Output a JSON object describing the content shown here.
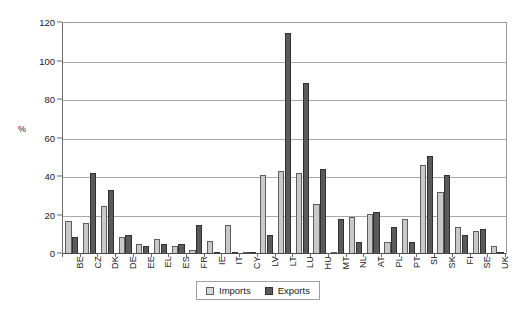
{
  "chart_data": {
    "type": "bar",
    "title": "",
    "xlabel": "",
    "ylabel": "%",
    "ylim": [
      0,
      120
    ],
    "yticks": [
      0,
      20,
      40,
      60,
      80,
      100,
      120
    ],
    "grid": true,
    "legend_position": "bottom-center",
    "categories": [
      "BE",
      "CZ",
      "DK",
      "DE",
      "EE",
      "EL",
      "ES",
      "FR",
      "IE",
      "IT",
      "CY",
      "LV",
      "LT",
      "LU",
      "HU",
      "MT",
      "NL",
      "AT",
      "PL",
      "PT",
      "SI",
      "SK",
      "FI",
      "SE",
      "UK"
    ],
    "series": [
      {
        "name": "Imports",
        "color": "#c9c9c9",
        "values": [
          17,
          16,
          25,
          9,
          5,
          8,
          4,
          2,
          7,
          15,
          0.4,
          41,
          43,
          42,
          26,
          0.3,
          19,
          21,
          6,
          18,
          46,
          32,
          14,
          12,
          4
        ]
      },
      {
        "name": "Exports",
        "color": "#5a5a5a",
        "values": [
          9,
          42,
          33,
          10,
          4,
          5,
          5,
          15,
          0.3,
          0.5,
          0.3,
          10,
          115,
          89,
          44,
          18,
          6,
          22,
          14,
          6,
          51,
          41,
          10,
          13,
          1
        ]
      }
    ]
  },
  "legend": {
    "items": [
      {
        "label": "Imports"
      },
      {
        "label": "Exports"
      }
    ]
  }
}
